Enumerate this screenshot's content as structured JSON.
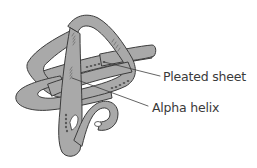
{
  "diagram": {
    "labels": [
      {
        "id": "pleated-sheet",
        "text": "Pleated sheet"
      },
      {
        "id": "alpha-helix",
        "text": "Alpha helix"
      }
    ],
    "colors": {
      "ribbon_fill": "#a9a9a9",
      "ribbon_outline": "#3c3c3c",
      "helix_marks": "#6e6e6e",
      "sheet_marks": "#555555",
      "label_text": "#3a3a3a",
      "leader_line": "#3c3c3c",
      "background": "#ffffff"
    }
  }
}
